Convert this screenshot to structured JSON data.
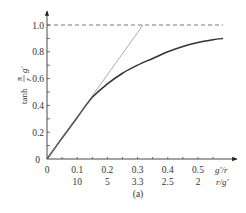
{
  "chart_data": {
    "type": "line",
    "title": "",
    "caption": "(a)",
    "xlabel": "g′/r",
    "xlabel_secondary": "r/g′",
    "ylabel": "tanh π/r g′",
    "ylabel_parts": {
      "fn": "tanh",
      "num": "π",
      "den": "r",
      "var": "g′"
    },
    "xlim": [
      0,
      0.6
    ],
    "ylim": [
      0,
      1.0
    ],
    "x_ticks": [
      0,
      0.1,
      0.2,
      0.3,
      0.4,
      0.5
    ],
    "x_tick_labels": [
      "0",
      "0.1",
      "0.2",
      "0.3",
      "0.4",
      "0.5"
    ],
    "x_tick_labels_secondary": [
      "",
      "10",
      "5",
      "3.3",
      "2.5",
      "2"
    ],
    "y_ticks": [
      0,
      0.2,
      0.4,
      0.6,
      0.8,
      1.0
    ],
    "y_tick_labels": [
      "0",
      "0.2",
      "0.4",
      "0.6",
      "0.8",
      "1.0"
    ],
    "grid": false,
    "legend": null,
    "series": [
      {
        "name": "tanh curve",
        "style": "solid-thick",
        "color": "#333333",
        "x": [
          0,
          0.05,
          0.1,
          0.15,
          0.2,
          0.25,
          0.3,
          0.35,
          0.4,
          0.45,
          0.5,
          0.55,
          0.583
        ],
        "values": [
          0,
          0.157,
          0.31,
          0.46,
          0.56,
          0.64,
          0.7,
          0.75,
          0.8,
          0.84,
          0.87,
          0.89,
          0.9
        ]
      },
      {
        "name": "linear tangent",
        "style": "solid-thin",
        "color": "#888888",
        "x": [
          0,
          0.318
        ],
        "values": [
          0,
          1.0
        ]
      },
      {
        "name": "asymptote y=1",
        "style": "dashed",
        "color": "#555555",
        "x": [
          0,
          0.583
        ],
        "values": [
          1.0,
          1.0
        ]
      }
    ]
  }
}
